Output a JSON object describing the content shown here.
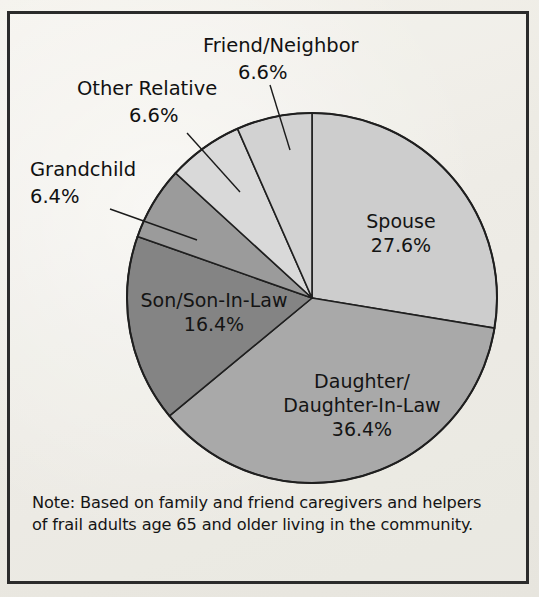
{
  "figure": {
    "background_color": "#eceae3",
    "frame_color": "#2b2b2b",
    "note": "Note: Based on family and friend caregivers and helpers of frail adults age 65 and older living in the community."
  },
  "chart_data": {
    "type": "pie",
    "title": "",
    "xlabel": "",
    "ylabel": "",
    "units": "percent",
    "start_angle_deg": 0,
    "direction": "clockwise",
    "center": {
      "x": 312,
      "y": 298
    },
    "radius": 185,
    "legend": "none",
    "grid": false,
    "categories": [
      "Spouse",
      "Daughter/Daughter-In-Law",
      "Son/Son-In-Law",
      "Grandchild",
      "Other Relative",
      "Friend/Neighbor"
    ],
    "values": [
      27.6,
      36.4,
      16.4,
      6.4,
      6.6,
      6.6
    ],
    "colors": [
      "#cdcdcd",
      "#a9a9a9",
      "#848484",
      "#9b9b9b",
      "#d9d9d9",
      "#d2d2d2"
    ],
    "slices": [
      {
        "label": "Spouse",
        "value": 27.6,
        "value_text": "27.6%",
        "color": "#cdcdcd",
        "label_placement": "inside",
        "label_lines": [
          "Spouse",
          "27.6%"
        ]
      },
      {
        "label": "Daughter/Daughter-In-Law",
        "value": 36.4,
        "value_text": "36.4%",
        "color": "#a9a9a9",
        "label_placement": "inside",
        "label_lines": [
          "Daughter/",
          "Daughter-In-Law",
          "36.4%"
        ]
      },
      {
        "label": "Son/Son-In-Law",
        "value": 16.4,
        "value_text": "16.4%",
        "color": "#848484",
        "label_placement": "inside",
        "label_lines": [
          "Son/Son-In-Law",
          "16.4%"
        ]
      },
      {
        "label": "Grandchild",
        "value": 6.4,
        "value_text": "6.4%",
        "color": "#9b9b9b",
        "label_placement": "callout",
        "label_lines": [
          "Grandchild",
          "6.4%"
        ]
      },
      {
        "label": "Other Relative",
        "value": 6.6,
        "value_text": "6.6%",
        "color": "#d9d9d9",
        "label_placement": "callout",
        "label_lines": [
          "Other Relative",
          "6.6%"
        ]
      },
      {
        "label": "Friend/Neighbor",
        "value": 6.6,
        "value_text": "6.6%",
        "color": "#d2d2d2",
        "label_placement": "callout",
        "label_lines": [
          "Friend/Neighbor",
          "6.6%"
        ]
      }
    ]
  },
  "labels": {
    "spouse_name": "Spouse",
    "spouse_pct": "27.6%",
    "daughter_name_1": "Daughter/",
    "daughter_name_2": "Daughter-In-Law",
    "daughter_pct": "36.4%",
    "son_name": "Son/Son-In-Law",
    "son_pct": "16.4%",
    "grandchild_name": "Grandchild",
    "grandchild_pct": "6.4%",
    "other_relative_name": "Other Relative",
    "other_relative_pct": "6.6%",
    "friend_name": "Friend/Neighbor",
    "friend_pct": "6.6%"
  },
  "note": {
    "text": "Note: Based on family and friend caregivers and helpers of frail adults age 65 and older living in the community."
  }
}
